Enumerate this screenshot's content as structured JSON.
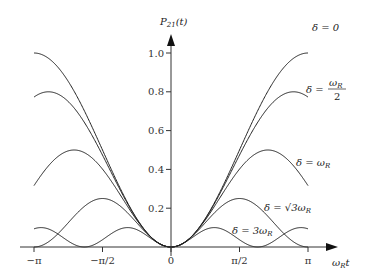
{
  "chart_data": {
    "type": "line",
    "title": "",
    "ylabel": "P21(t)",
    "xlabel": "ωR t",
    "xlim": [
      -3.14159,
      3.14159
    ],
    "ylim": [
      0,
      1.0
    ],
    "x_ticks": [
      "−π",
      "−π/2",
      "0",
      "π/2",
      "π"
    ],
    "y_ticks": [
      "0.2",
      "0.4",
      "0.6",
      "0.8",
      "1.0"
    ],
    "grid": false,
    "legend": "inline labels at right",
    "formula": "P21 = (ωR²/(ωR²+δ²)) sin²(√(ωR²+δ²) t / 2)",
    "series": [
      {
        "name": "δ = 0",
        "delta_over_omegaR": 0,
        "max": 1.0
      },
      {
        "name": "δ = ωR/2",
        "delta_over_omegaR": 0.5,
        "max": 0.8
      },
      {
        "name": "δ = ωR",
        "delta_over_omegaR": 1.0,
        "max": 0.5
      },
      {
        "name": "δ = √3 ωR",
        "delta_over_omegaR": 1.732,
        "max": 0.25
      },
      {
        "name": "δ = 3ωR",
        "delta_over_omegaR": 3.0,
        "max": 0.1
      }
    ]
  },
  "labels": {
    "ylabel": "P₂₁(t)",
    "xlabel": "ωRt",
    "s0": "δ = 0",
    "s1": "δ = ωR/2",
    "s2": "δ = ωR",
    "s3": "δ = √3ωR",
    "s4": "δ = 3ωR"
  }
}
